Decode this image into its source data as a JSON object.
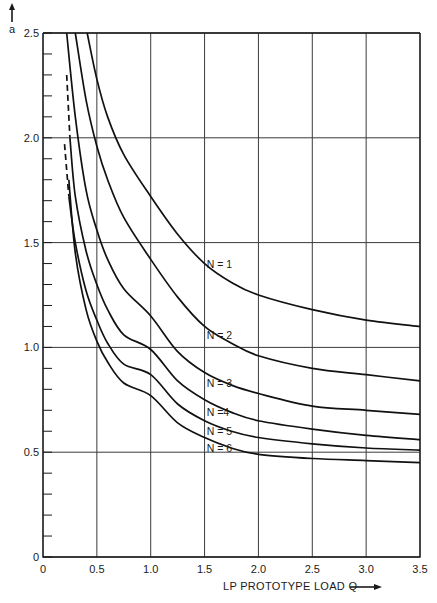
{
  "chart_data": {
    "type": "line",
    "title": "",
    "xlabel": "LP PROTOTYPE LOAD Q",
    "ylabel": "a",
    "xlim": [
      0,
      3.5
    ],
    "ylim": [
      0,
      2.5
    ],
    "grid": true,
    "x_ticks": [
      "0",
      "0.5",
      "1.0",
      "1.5",
      "2.0",
      "2.5",
      "3.0",
      "3.5"
    ],
    "y_ticks": [
      "0",
      "0.5",
      "1.0",
      "1.5",
      "2.0",
      "2.5"
    ],
    "y_minor_step": 0.1,
    "legend": "inline curve labels",
    "series": [
      {
        "name": "N = 1",
        "label_at": [
          1.52,
          1.4
        ],
        "points": [
          [
            0.41,
            2.5
          ],
          [
            0.5,
            2.28
          ],
          [
            0.6,
            2.1
          ],
          [
            0.75,
            1.92
          ],
          [
            1.0,
            1.72
          ],
          [
            1.25,
            1.54
          ],
          [
            1.5,
            1.4
          ],
          [
            1.75,
            1.31
          ],
          [
            2.0,
            1.25
          ],
          [
            2.5,
            1.18
          ],
          [
            3.0,
            1.13
          ],
          [
            3.5,
            1.1
          ]
        ]
      },
      {
        "name": "N = 2",
        "label_at": [
          1.52,
          1.06
        ],
        "points": [
          [
            0.3,
            2.5
          ],
          [
            0.4,
            2.18
          ],
          [
            0.5,
            1.96
          ],
          [
            0.6,
            1.8
          ],
          [
            0.75,
            1.62
          ],
          [
            1.0,
            1.42
          ],
          [
            1.25,
            1.24
          ],
          [
            1.5,
            1.1
          ],
          [
            1.75,
            1.02
          ],
          [
            2.0,
            0.96
          ],
          [
            2.5,
            0.9
          ],
          [
            3.0,
            0.87
          ],
          [
            3.5,
            0.84
          ]
        ]
      },
      {
        "name": "N = 3",
        "label_at": [
          1.52,
          0.83
        ],
        "points": [
          [
            0.22,
            2.5
          ],
          [
            0.3,
            2.1
          ],
          [
            0.4,
            1.75
          ],
          [
            0.5,
            1.56
          ],
          [
            0.6,
            1.42
          ],
          [
            0.75,
            1.28
          ],
          [
            1.0,
            1.15
          ],
          [
            1.25,
            0.98
          ],
          [
            1.5,
            0.88
          ],
          [
            1.75,
            0.82
          ],
          [
            2.0,
            0.78
          ],
          [
            2.5,
            0.72
          ],
          [
            3.0,
            0.7
          ],
          [
            3.5,
            0.68
          ]
        ]
      },
      {
        "name": "N =4",
        "label_at": [
          1.52,
          0.69
        ],
        "dashed_start": [
          [
            0.22,
            2.3
          ],
          [
            0.25,
            2.0
          ]
        ],
        "points": [
          [
            0.25,
            2.0
          ],
          [
            0.3,
            1.72
          ],
          [
            0.4,
            1.46
          ],
          [
            0.5,
            1.3
          ],
          [
            0.6,
            1.18
          ],
          [
            0.75,
            1.06
          ],
          [
            1.0,
            0.99
          ],
          [
            1.25,
            0.84
          ],
          [
            1.5,
            0.75
          ],
          [
            1.75,
            0.69
          ],
          [
            2.0,
            0.65
          ],
          [
            2.5,
            0.61
          ],
          [
            3.0,
            0.58
          ],
          [
            3.5,
            0.56
          ]
        ]
      },
      {
        "name": "N = 5",
        "label_at": [
          1.52,
          0.6
        ],
        "dashed_start": [
          [
            0.2,
            1.97
          ],
          [
            0.24,
            1.72
          ]
        ],
        "points": [
          [
            0.24,
            1.72
          ],
          [
            0.3,
            1.5
          ],
          [
            0.4,
            1.27
          ],
          [
            0.5,
            1.13
          ],
          [
            0.6,
            1.02
          ],
          [
            0.75,
            0.92
          ],
          [
            1.0,
            0.87
          ],
          [
            1.25,
            0.73
          ],
          [
            1.5,
            0.65
          ],
          [
            1.75,
            0.6
          ],
          [
            2.0,
            0.57
          ],
          [
            2.5,
            0.54
          ],
          [
            3.0,
            0.52
          ],
          [
            3.5,
            0.51
          ]
        ]
      },
      {
        "name": "N = 6",
        "label_at": [
          1.52,
          0.52
        ],
        "points": [
          [
            0.24,
            1.8
          ],
          [
            0.3,
            1.45
          ],
          [
            0.4,
            1.18
          ],
          [
            0.5,
            1.03
          ],
          [
            0.6,
            0.93
          ],
          [
            0.75,
            0.83
          ],
          [
            1.0,
            0.77
          ],
          [
            1.25,
            0.64
          ],
          [
            1.5,
            0.57
          ],
          [
            1.75,
            0.52
          ],
          [
            2.0,
            0.49
          ],
          [
            2.5,
            0.47
          ],
          [
            3.0,
            0.46
          ],
          [
            3.5,
            0.45
          ]
        ]
      }
    ]
  }
}
